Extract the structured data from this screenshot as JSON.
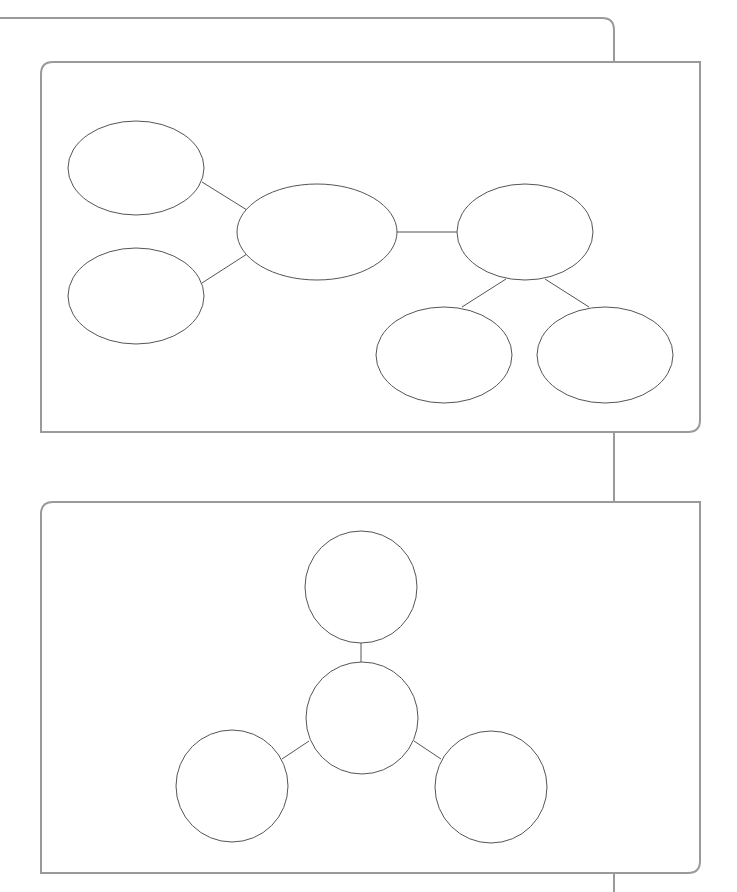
{
  "page": {
    "title": "",
    "background": "#ffffff"
  },
  "colors": {
    "frame_stroke": "#9a9a9a",
    "shape_stroke": "#555555",
    "shape_fill": "#ffffff"
  },
  "frame": {
    "top_line": {
      "x1": 0,
      "y1": 18,
      "x2": 602,
      "y2": 18
    },
    "top_corner": {
      "x": 602,
      "y": 18,
      "radius": 12,
      "down_to_y": 62
    },
    "connector_1_2": {
      "x": 614,
      "y1": 432,
      "y2": 502
    },
    "connector_2_bottom": {
      "x": 614,
      "y1": 873,
      "y2": 892
    }
  },
  "panels": [
    {
      "id": "panel-1",
      "label": "",
      "x": 41,
      "y": 62,
      "width": 659,
      "height": 370,
      "radius": 12,
      "diagram": {
        "type": "tree-ellipses",
        "nodes": [
          {
            "id": "A",
            "label": "",
            "cx": 136,
            "cy": 168,
            "rx": 68,
            "ry": 47
          },
          {
            "id": "B",
            "label": "",
            "cx": 136,
            "cy": 296,
            "rx": 68,
            "ry": 48
          },
          {
            "id": "C",
            "label": "",
            "cx": 317,
            "cy": 232,
            "rx": 80,
            "ry": 48
          },
          {
            "id": "D",
            "label": "",
            "cx": 525,
            "cy": 232,
            "rx": 68,
            "ry": 48
          },
          {
            "id": "E",
            "label": "",
            "cx": 444,
            "cy": 355,
            "rx": 68,
            "ry": 48
          },
          {
            "id": "F",
            "label": "",
            "cx": 605,
            "cy": 355,
            "rx": 68,
            "ry": 48
          }
        ],
        "edges": [
          {
            "from": "A",
            "to": "C",
            "x1": 202,
            "y1": 182,
            "x2": 247,
            "y2": 210
          },
          {
            "from": "B",
            "to": "C",
            "x1": 202,
            "y1": 283,
            "x2": 247,
            "y2": 254
          },
          {
            "from": "C",
            "to": "D",
            "x1": 397,
            "y1": 232,
            "x2": 457,
            "y2": 232
          },
          {
            "from": "D",
            "to": "E",
            "x1": 506,
            "y1": 279,
            "x2": 462,
            "y2": 307
          },
          {
            "from": "D",
            "to": "F",
            "x1": 545,
            "y1": 279,
            "x2": 589,
            "y2": 307
          }
        ]
      }
    },
    {
      "id": "panel-2",
      "label": "",
      "x": 41,
      "y": 502,
      "width": 659,
      "height": 371,
      "radius": 12,
      "diagram": {
        "type": "hub-circles",
        "nodes": [
          {
            "id": "top",
            "label": "",
            "cx": 361,
            "cy": 587,
            "r": 56
          },
          {
            "id": "center",
            "label": "",
            "cx": 362,
            "cy": 718,
            "r": 56
          },
          {
            "id": "left",
            "label": "",
            "cx": 232,
            "cy": 786,
            "r": 56
          },
          {
            "id": "right",
            "label": "",
            "cx": 491,
            "cy": 787,
            "r": 56
          }
        ],
        "edges": [
          {
            "from": "top",
            "to": "center",
            "x1": 361,
            "y1": 643,
            "x2": 361,
            "y2": 662
          },
          {
            "from": "center",
            "to": "left",
            "x1": 309,
            "y1": 741,
            "x2": 282,
            "y2": 759
          },
          {
            "from": "center",
            "to": "right",
            "x1": 414,
            "y1": 741,
            "x2": 441,
            "y2": 759
          }
        ]
      }
    }
  ]
}
